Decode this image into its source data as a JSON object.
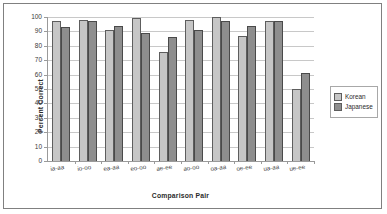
{
  "chart_data": {
    "type": "bar",
    "title": "",
    "xlabel": "Comparison Pair",
    "ylabel": "Percent Correct",
    "categories": [
      "ia-aa",
      "io-oo",
      "ea-aa",
      "eo-oo",
      "ae-ee",
      "ao-oo",
      "oa-aa",
      "oe-ee",
      "ua-aa",
      "ue-ee"
    ],
    "series": [
      {
        "name": "Korean",
        "color": "#c6c6c6",
        "values": [
          97,
          98,
          91,
          99,
          76,
          98,
          100,
          87,
          97,
          50
        ]
      },
      {
        "name": "Japanese",
        "color": "#8e8e8e",
        "values": [
          93,
          97,
          94,
          89,
          86,
          91,
          97,
          94,
          97,
          61
        ]
      }
    ],
    "ylim": [
      0,
      100
    ],
    "yticks": [
      0,
      10,
      20,
      30,
      40,
      50,
      60,
      70,
      80,
      90,
      100
    ],
    "ytick_labels": [
      "0",
      "10",
      "20",
      "30",
      "40",
      "50",
      "60",
      "70",
      "80",
      "90",
      "100"
    ],
    "grid": true,
    "legend_position": "right"
  },
  "legend": {
    "items": [
      {
        "label": "Korean"
      },
      {
        "label": "Japanese"
      }
    ]
  }
}
